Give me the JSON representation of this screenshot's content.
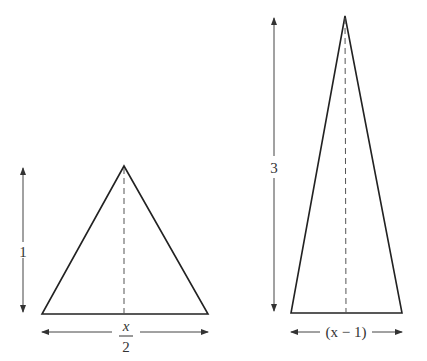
{
  "diagram": {
    "left_triangle": {
      "height_label": "1",
      "base_label_numerator": "x",
      "base_label_denominator": "2",
      "apex": [
        124,
        166
      ],
      "base_left": [
        42,
        314
      ],
      "base_right": [
        208,
        314
      ]
    },
    "right_triangle": {
      "height_label": "3",
      "base_label": "(x − 1)",
      "apex": [
        345,
        16
      ],
      "base_left": [
        291,
        313
      ],
      "base_right": [
        402,
        313
      ]
    },
    "colors": {
      "stroke": "#222222",
      "dim": "#444444",
      "background": "#ffffff"
    }
  }
}
